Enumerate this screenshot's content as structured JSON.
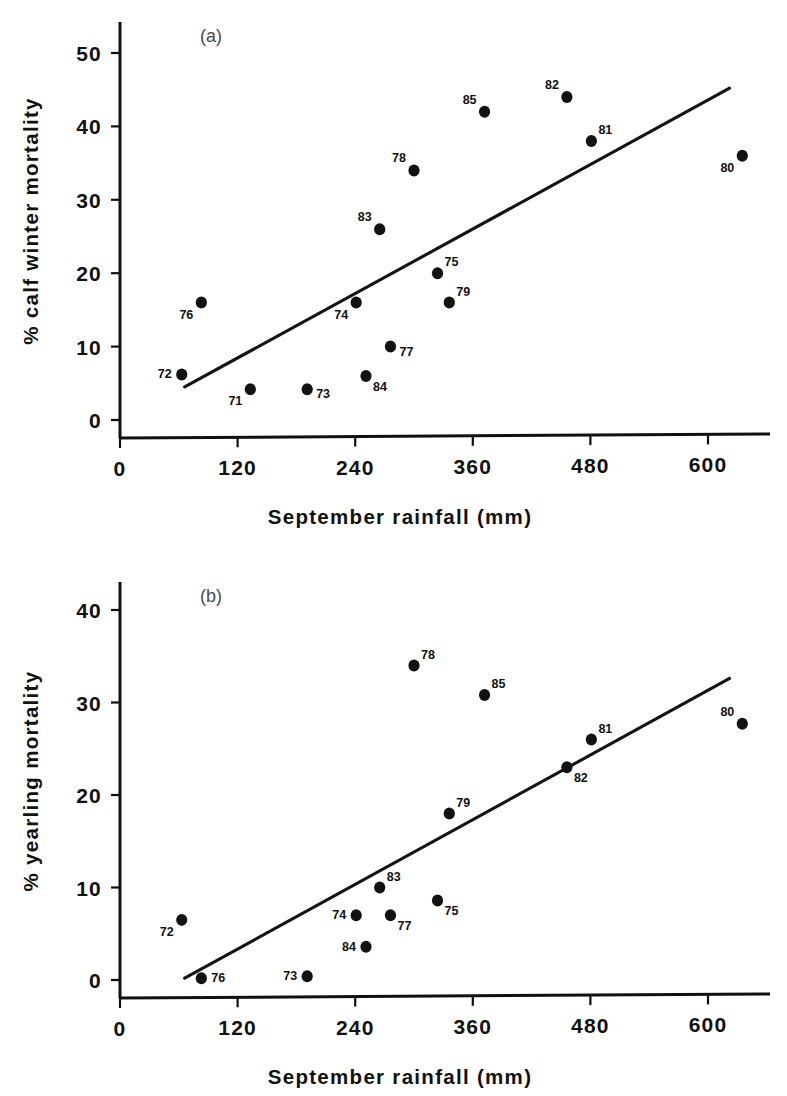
{
  "figure": {
    "background_color": "#ffffff",
    "ink_color": "#111111"
  },
  "chart_data": [
    {
      "type": "scatter",
      "panel_label": "(a)",
      "title": "",
      "xlabel": "September rainfall (mm)",
      "ylabel": "% calf winter mortality",
      "xlim": [
        0,
        660
      ],
      "ylim": [
        0,
        54
      ],
      "xticks": [
        0,
        120,
        240,
        360,
        480,
        600
      ],
      "xticklabels": [
        "0",
        "120",
        "240",
        "360",
        "480",
        "600"
      ],
      "yticks": [
        0,
        10,
        20,
        30,
        40,
        50
      ],
      "yticklabels": [
        "0",
        "10",
        "20",
        "30",
        "40",
        "50"
      ],
      "grid": false,
      "legend": "none",
      "point_label_key": "year",
      "points": [
        {
          "year": "71",
          "x": 133,
          "y": 4.2,
          "label_pos": "below-left"
        },
        {
          "year": "72",
          "x": 63,
          "y": 6.2,
          "label_pos": "left"
        },
        {
          "year": "73",
          "x": 191,
          "y": 4.2,
          "label_pos": "right-below"
        },
        {
          "year": "74",
          "x": 241,
          "y": 16.0,
          "label_pos": "below-left"
        },
        {
          "year": "75",
          "x": 324,
          "y": 20.0,
          "label_pos": "above-right"
        },
        {
          "year": "76",
          "x": 83,
          "y": 16.0,
          "label_pos": "below-left"
        },
        {
          "year": "77",
          "x": 276,
          "y": 10.0,
          "label_pos": "right-below"
        },
        {
          "year": "78",
          "x": 300,
          "y": 34.0,
          "label_pos": "above-left"
        },
        {
          "year": "79",
          "x": 336,
          "y": 16.0,
          "label_pos": "above-right"
        },
        {
          "year": "80",
          "x": 635,
          "y": 36.0,
          "label_pos": "below-left"
        },
        {
          "year": "81",
          "x": 481,
          "y": 38.0,
          "label_pos": "above-right"
        },
        {
          "year": "82",
          "x": 456,
          "y": 44.0,
          "label_pos": "above-left"
        },
        {
          "year": "83",
          "x": 265,
          "y": 26.0,
          "label_pos": "above-left"
        },
        {
          "year": "84",
          "x": 251,
          "y": 6.0,
          "label_pos": "below-right"
        },
        {
          "year": "85",
          "x": 372,
          "y": 42.0,
          "label_pos": "above-left"
        }
      ],
      "regression_line": {
        "x_start": 66,
        "y_start": 4.5,
        "x_end": 622,
        "y_end": 45.2
      }
    },
    {
      "type": "scatter",
      "panel_label": "(b)",
      "title": "",
      "xlabel": "September rainfall (mm)",
      "ylabel": "% yearling mortality",
      "xlim": [
        0,
        660
      ],
      "ylim": [
        0,
        43
      ],
      "xticks": [
        0,
        120,
        240,
        360,
        480,
        600
      ],
      "xticklabels": [
        "0",
        "120",
        "240",
        "360",
        "480",
        "600"
      ],
      "yticks": [
        0,
        10,
        20,
        30,
        40
      ],
      "yticklabels": [
        "0",
        "10",
        "20",
        "30",
        "40"
      ],
      "grid": false,
      "legend": "none",
      "point_label_key": "year",
      "points": [
        {
          "year": "72",
          "x": 63,
          "y": 6.5,
          "label_pos": "below-left"
        },
        {
          "year": "73",
          "x": 191,
          "y": 0.4,
          "label_pos": "left"
        },
        {
          "year": "74",
          "x": 241,
          "y": 7.0,
          "label_pos": "left"
        },
        {
          "year": "75",
          "x": 324,
          "y": 8.6,
          "label_pos": "below-right"
        },
        {
          "year": "76",
          "x": 83,
          "y": 0.2,
          "label_pos": "right"
        },
        {
          "year": "77",
          "x": 276,
          "y": 7.0,
          "label_pos": "below-right"
        },
        {
          "year": "78",
          "x": 300,
          "y": 34.0,
          "label_pos": "above-right"
        },
        {
          "year": "79",
          "x": 336,
          "y": 18.0,
          "label_pos": "above-right"
        },
        {
          "year": "80",
          "x": 635,
          "y": 27.7,
          "label_pos": "above-left"
        },
        {
          "year": "81",
          "x": 481,
          "y": 26.0,
          "label_pos": "above-right"
        },
        {
          "year": "82",
          "x": 456,
          "y": 23.0,
          "label_pos": "below-right"
        },
        {
          "year": "83",
          "x": 265,
          "y": 10.0,
          "label_pos": "above-right"
        },
        {
          "year": "84",
          "x": 251,
          "y": 3.6,
          "label_pos": "left"
        },
        {
          "year": "85",
          "x": 372,
          "y": 30.8,
          "label_pos": "above-right"
        }
      ],
      "regression_line": {
        "x_start": 66,
        "y_start": 0.2,
        "x_end": 622,
        "y_end": 32.6
      }
    }
  ]
}
